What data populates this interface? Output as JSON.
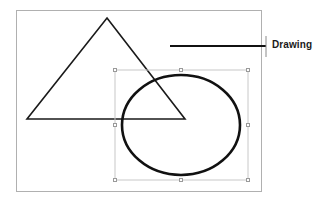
{
  "canvas": {
    "name": "drawing-canvas",
    "background_color": "#ffffff",
    "border_color": "#b0b0b0",
    "bounds": {
      "x": 16,
      "y": 10,
      "width": 246,
      "height": 182
    }
  },
  "shapes": [
    {
      "id": "triangle",
      "type": "triangle",
      "stroke_color": "#1a1a1a",
      "stroke_width": 1.6,
      "fill": "none",
      "selected": false,
      "points": "107,18 185,119 27,119"
    },
    {
      "id": "ellipse",
      "type": "ellipse",
      "stroke_color": "#111111",
      "stroke_width": 2.6,
      "fill": "none",
      "selected": true,
      "center": {
        "cx": 181,
        "cy": 125
      },
      "radii": {
        "rx": 59,
        "ry": 50
      }
    }
  ],
  "selection": {
    "name": "selection-bounding-box",
    "border_color": "#c8c8c8",
    "handle_fill": "#ffffff",
    "handle_border": "#9a9a9a",
    "bounds": {
      "x": 115,
      "y": 70,
      "width": 133,
      "height": 110
    },
    "handles": [
      {
        "id": "handle-nw",
        "x": 115,
        "y": 70
      },
      {
        "id": "handle-n",
        "x": 181,
        "y": 70
      },
      {
        "id": "handle-ne",
        "x": 248,
        "y": 70
      },
      {
        "id": "handle-w",
        "x": 115,
        "y": 125
      },
      {
        "id": "handle-e",
        "x": 248,
        "y": 125
      },
      {
        "id": "handle-sw",
        "x": 115,
        "y": 180
      },
      {
        "id": "handle-s",
        "x": 181,
        "y": 180
      },
      {
        "id": "handle-se",
        "x": 248,
        "y": 180
      }
    ]
  },
  "callout": {
    "name": "drawing-callout",
    "label": "Drawing",
    "text_color": "#1a1a1a",
    "leader_line": {
      "color": "#111111",
      "width": 2,
      "x1": 170,
      "y1": 46,
      "x2": 266,
      "y2": 46
    },
    "tick": {
      "color": "#8a8a8a",
      "width": 1,
      "x": 266,
      "y1": 36,
      "y2": 57
    }
  }
}
